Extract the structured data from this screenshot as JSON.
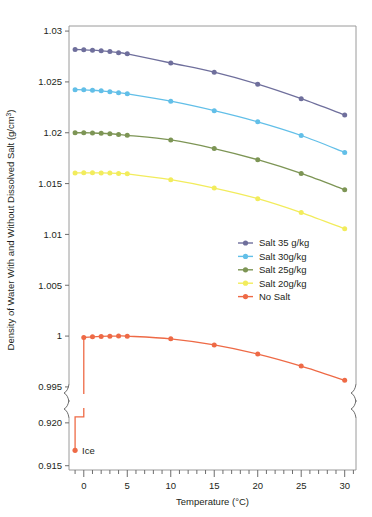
{
  "chart_data": {
    "type": "line",
    "title": "",
    "subtitle": "",
    "xlabel": "Temperature (°C)",
    "ylabel": "Density of Water With and Without Dissolved Salt (g/cm³)",
    "ylabel_base": "Density of Water With and Without Dissolved Salt (g/cm",
    "ylabel_sup": "3",
    "ylabel_tail": ")",
    "grid": false,
    "legend_position": "inside-right-middle",
    "broken_axis": true,
    "xlim": [
      -1.7,
      31.3
    ],
    "xticks_major": [
      0,
      5,
      10,
      15,
      20,
      25,
      30
    ],
    "xticks_major_labels": [
      "0",
      "5",
      "10",
      "15",
      "20",
      "25",
      "30"
    ],
    "xtick_minor_step": 1,
    "panels": [
      {
        "name": "upper-panel",
        "ylim": [
          0.9945,
          1.0305
        ],
        "yticks": [
          1.03,
          1.025,
          1.02,
          1.015,
          1.01,
          1.005,
          1.0,
          0.995
        ],
        "ytick_labels": [
          "1.03",
          "1.025",
          "1.02",
          "1.015",
          "1.01",
          "1.005",
          "1",
          "0.995"
        ]
      },
      {
        "name": "lower-panel",
        "ylim": [
          0.9145,
          0.9215
        ],
        "yticks": [
          0.92,
          0.915
        ],
        "ytick_labels": [
          "0.920",
          "0.915"
        ]
      }
    ],
    "x": [
      -1,
      0,
      1,
      2,
      3,
      4,
      5,
      10,
      15,
      20,
      25,
      30
    ],
    "series": [
      {
        "name": "Salt 35 g/kg",
        "color": "#6f6f9c",
        "panel": "upper-panel",
        "x": [
          -1,
          0,
          1,
          2,
          3,
          4,
          5,
          10,
          15,
          20,
          25,
          30
        ],
        "values": [
          1.02819,
          1.02816,
          1.02812,
          1.02806,
          1.02798,
          1.02788,
          1.02776,
          1.02686,
          1.02596,
          1.02478,
          1.02335,
          1.02175
        ]
      },
      {
        "name": "Salt 30g/kg",
        "color": "#62bfe8",
        "panel": "upper-panel",
        "x": [
          -1,
          0,
          1,
          2,
          3,
          4,
          5,
          10,
          15,
          20,
          25,
          30
        ],
        "values": [
          1.02424,
          1.02422,
          1.02418,
          1.02412,
          1.02404,
          1.02394,
          1.02383,
          1.0231,
          1.02217,
          1.02107,
          1.01973,
          1.01806
        ]
      },
      {
        "name": "Salt 25g/kg",
        "color": "#7d9555",
        "panel": "upper-panel",
        "x": [
          -1,
          0,
          1,
          2,
          3,
          4,
          5,
          10,
          15,
          20,
          25,
          30
        ],
        "values": [
          1.02,
          1.02,
          1.01998,
          1.01995,
          1.0199,
          1.01983,
          1.01975,
          1.01929,
          1.01845,
          1.01735,
          1.016,
          1.0144
        ]
      },
      {
        "name": "Salt 20g/kg",
        "color": "#f2ec5c",
        "panel": "upper-panel",
        "x": [
          -1,
          0,
          1,
          2,
          3,
          4,
          5,
          10,
          15,
          20,
          25,
          30
        ],
        "values": [
          1.01605,
          1.01606,
          1.01606,
          1.01605,
          1.01603,
          1.016,
          1.01596,
          1.01538,
          1.01456,
          1.01352,
          1.01215,
          1.01055
        ]
      },
      {
        "name": "No Salt",
        "color": "#ee6a46",
        "panel": "upper-panel",
        "x": [
          0,
          1,
          2,
          3,
          4,
          5,
          10,
          15,
          20,
          25,
          30
        ],
        "values": [
          0.99987,
          0.99993,
          0.99997,
          0.99999,
          1.0,
          0.99999,
          0.99973,
          0.99913,
          0.99823,
          0.99705,
          0.99565
        ]
      },
      {
        "name": "Ice",
        "color": "#ee6a46",
        "panel": "lower-panel",
        "x": [
          -1
        ],
        "values": [
          0.9168
        ],
        "annotation": "Ice",
        "drop_from": 0.99987,
        "drop_x": 0
      }
    ],
    "annotations": [
      {
        "text": "Ice",
        "x": -1,
        "y": 0.9168,
        "panel": "lower-panel"
      }
    ],
    "legend": [
      {
        "label": "Salt 35 g/kg",
        "color": "#6f6f9c"
      },
      {
        "label": "Salt 30g/kg",
        "color": "#62bfe8"
      },
      {
        "label": "Salt 25g/kg",
        "color": "#7d9555"
      },
      {
        "label": "Salt 20g/kg",
        "color": "#f2ec5c"
      },
      {
        "label": "No Salt",
        "color": "#ee6a46"
      }
    ]
  }
}
